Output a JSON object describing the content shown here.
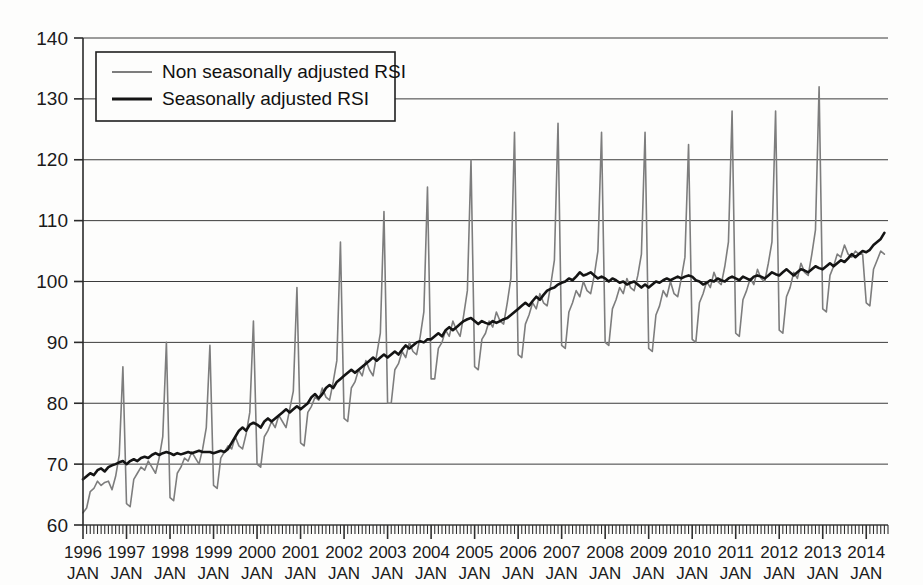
{
  "chart_data": {
    "type": "line",
    "title": "",
    "xlabel": "",
    "ylabel": "",
    "ylim": [
      60,
      140
    ],
    "ytick_values": [
      60,
      70,
      80,
      90,
      100,
      110,
      120,
      130,
      140
    ],
    "ytick_labels": [
      "60",
      "70",
      "80",
      "90",
      "100",
      "110",
      "120",
      "130",
      "140"
    ],
    "grid": true,
    "legend_position": "top-left",
    "x_start": "1996-01",
    "x_end": "2014-06",
    "x_frequency": "monthly",
    "xtick_years": [
      "1996",
      "1997",
      "1998",
      "1999",
      "2000",
      "2001",
      "2002",
      "2003",
      "2004",
      "2005",
      "2006",
      "2007",
      "2008",
      "2009",
      "2010",
      "2011",
      "2012",
      "2013",
      "2014"
    ],
    "xtick_month_label": "JAN",
    "series": [
      {
        "name": "Non seasonally adjusted RSI",
        "color": "#7d7d7d",
        "width": 1.6,
        "values": [
          62.0,
          62.8,
          65.5,
          66.0,
          67.2,
          66.5,
          67.0,
          67.2,
          65.8,
          68.0,
          71.5,
          86.0,
          63.5,
          63.0,
          67.5,
          68.5,
          69.5,
          69.0,
          70.5,
          69.5,
          68.5,
          71.0,
          74.5,
          90.0,
          64.5,
          64.0,
          68.5,
          69.5,
          71.0,
          70.5,
          72.0,
          71.0,
          70.0,
          72.5,
          76.0,
          89.5,
          66.5,
          66.0,
          71.0,
          72.0,
          73.0,
          72.5,
          74.5,
          73.0,
          72.5,
          75.0,
          78.5,
          93.5,
          70.0,
          69.5,
          74.5,
          75.5,
          77.0,
          76.0,
          78.0,
          77.0,
          76.0,
          79.0,
          82.0,
          99.0,
          73.5,
          73.0,
          78.5,
          79.5,
          81.0,
          80.5,
          82.5,
          81.0,
          80.5,
          83.5,
          87.0,
          106.5,
          77.5,
          77.0,
          82.5,
          83.5,
          85.5,
          84.5,
          87.0,
          85.5,
          84.5,
          88.0,
          91.5,
          111.5,
          80.0,
          80.0,
          85.5,
          86.5,
          88.5,
          87.5,
          90.0,
          88.5,
          88.0,
          91.0,
          95.0,
          115.5,
          84.0,
          84.0,
          89.0,
          90.0,
          92.0,
          91.0,
          93.5,
          92.0,
          91.0,
          94.5,
          98.5,
          120.0,
          86.0,
          85.5,
          90.5,
          91.5,
          93.5,
          92.5,
          95.0,
          93.5,
          93.0,
          96.5,
          100.5,
          124.5,
          88.0,
          87.5,
          93.0,
          94.5,
          96.5,
          95.5,
          98.0,
          96.5,
          96.0,
          99.5,
          103.5,
          126.0,
          89.5,
          89.0,
          95.0,
          96.5,
          98.5,
          97.5,
          100.0,
          98.5,
          98.0,
          101.0,
          105.0,
          124.5,
          90.0,
          89.5,
          95.5,
          97.0,
          99.0,
          98.0,
          100.5,
          99.0,
          98.5,
          101.0,
          104.5,
          124.5,
          89.0,
          88.5,
          94.5,
          96.0,
          98.5,
          97.5,
          100.0,
          98.0,
          97.5,
          100.5,
          104.0,
          122.5,
          90.5,
          90.0,
          96.5,
          98.0,
          100.0,
          99.0,
          101.5,
          100.0,
          99.5,
          102.5,
          106.5,
          128.0,
          91.5,
          91.0,
          97.0,
          98.5,
          100.5,
          99.5,
          102.0,
          100.5,
          100.0,
          103.0,
          106.5,
          128.0,
          92.0,
          91.5,
          97.5,
          99.0,
          101.5,
          100.5,
          103.0,
          101.5,
          101.0,
          104.5,
          108.5,
          132.0,
          95.5,
          95.0,
          101.0,
          102.5,
          104.5,
          104.0,
          106.0,
          104.5,
          104.0,
          105.0,
          104.5,
          104.5,
          96.5,
          96.0,
          102.0,
          103.5,
          105.0,
          104.5
        ]
      },
      {
        "name": "Seasonally adjusted RSI",
        "color": "#141414",
        "width": 2.6,
        "values": [
          67.5,
          68.0,
          68.5,
          68.2,
          69.0,
          69.3,
          68.8,
          69.5,
          69.8,
          70.0,
          70.3,
          70.5,
          70.0,
          70.5,
          70.8,
          70.5,
          71.0,
          71.2,
          71.0,
          71.5,
          71.8,
          71.5,
          71.8,
          72.0,
          71.8,
          71.5,
          71.8,
          71.6,
          71.8,
          72.0,
          71.8,
          72.0,
          72.2,
          72.0,
          72.0,
          72.0,
          71.8,
          72.0,
          72.2,
          72.0,
          72.5,
          73.5,
          74.5,
          75.5,
          76.0,
          75.5,
          76.5,
          76.8,
          76.5,
          76.0,
          77.0,
          77.5,
          77.0,
          77.5,
          78.0,
          78.5,
          79.0,
          78.5,
          79.0,
          79.5,
          79.0,
          79.5,
          80.0,
          81.0,
          81.5,
          80.8,
          81.5,
          82.5,
          83.0,
          82.5,
          83.5,
          84.0,
          84.5,
          85.0,
          85.5,
          85.0,
          85.5,
          86.0,
          86.5,
          87.0,
          87.5,
          87.0,
          87.5,
          88.0,
          87.5,
          88.0,
          88.5,
          88.0,
          88.8,
          89.5,
          89.0,
          89.5,
          90.0,
          90.2,
          90.0,
          90.5,
          90.5,
          91.0,
          91.5,
          91.0,
          92.0,
          92.5,
          92.0,
          92.5,
          93.0,
          93.5,
          93.8,
          94.0,
          93.5,
          93.0,
          93.5,
          93.2,
          93.0,
          93.5,
          93.2,
          93.5,
          93.8,
          94.0,
          94.5,
          95.0,
          95.5,
          96.0,
          96.5,
          96.0,
          96.8,
          97.5,
          97.0,
          97.8,
          98.5,
          98.8,
          99.0,
          99.5,
          99.8,
          100.0,
          100.5,
          100.2,
          100.8,
          101.5,
          101.0,
          101.2,
          101.5,
          101.0,
          100.5,
          100.8,
          100.5,
          100.0,
          100.5,
          100.2,
          99.8,
          100.0,
          99.5,
          99.8,
          100.0,
          99.5,
          99.0,
          99.5,
          99.0,
          99.5,
          100.0,
          99.8,
          100.2,
          100.5,
          100.2,
          100.5,
          100.8,
          100.5,
          100.8,
          101.0,
          100.8,
          100.2,
          100.0,
          99.5,
          99.8,
          100.2,
          100.0,
          100.5,
          100.2,
          100.0,
          100.5,
          100.8,
          100.5,
          100.2,
          100.8,
          100.5,
          100.2,
          100.8,
          101.0,
          100.8,
          100.5,
          101.0,
          101.5,
          101.2,
          101.0,
          101.5,
          102.0,
          101.5,
          101.0,
          101.5,
          102.0,
          101.8,
          101.5,
          102.0,
          102.5,
          102.2,
          102.0,
          102.5,
          103.0,
          102.5,
          103.0,
          103.5,
          103.2,
          103.8,
          104.5,
          104.0,
          104.5,
          105.0,
          104.8,
          105.2,
          106.0,
          106.5,
          107.0,
          108.0
        ]
      }
    ]
  },
  "legend": {
    "items": [
      {
        "label": "Non seasonally adjusted RSI",
        "color": "#7d7d7d"
      },
      {
        "label": "Seasonally adjusted RSI",
        "color": "#141414"
      }
    ]
  }
}
